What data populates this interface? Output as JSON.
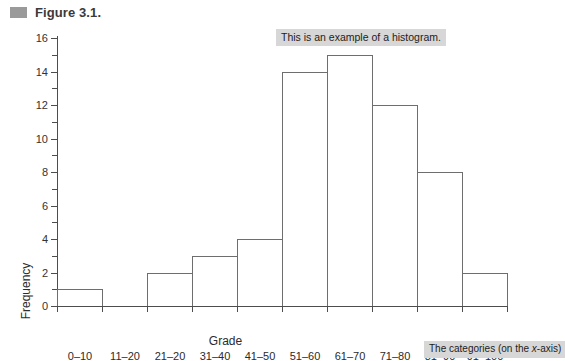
{
  "figure": {
    "title": "Figure 3.1.",
    "marker_color": "#9a9a9a"
  },
  "annotations": {
    "histogram_note": "This is an example of a histogram.",
    "categories_note_pre": "The categories (on the ",
    "categories_note_italic": "x",
    "categories_note_post": "-axis)",
    "box_color": "#d7d7d7"
  },
  "chart_data": {
    "type": "bar",
    "title": "Figure 3.1.",
    "subtitle": "",
    "xlabel": "Grade",
    "ylabel": "Frequency",
    "categories": [
      "0–10",
      "11–20",
      "21–20",
      "31–40",
      "41–50",
      "51–60",
      "61–70",
      "71–80",
      "81–90",
      "91–100"
    ],
    "values": [
      1,
      0,
      2,
      3,
      4,
      14,
      15,
      12,
      8,
      2
    ],
    "ylim": [
      0,
      16
    ],
    "ytick_values": [
      0,
      2,
      4,
      6,
      8,
      10,
      12,
      14,
      16
    ],
    "ytick_labels": [
      "0",
      "2",
      "4",
      "6",
      "8",
      "10",
      "12",
      "14",
      "16"
    ],
    "yminor_step": 1,
    "grid": false,
    "legend": false,
    "bar_fill": "#ffffff",
    "bar_stroke": "#6e6e6e",
    "axis_color": "#4d4d4d"
  }
}
